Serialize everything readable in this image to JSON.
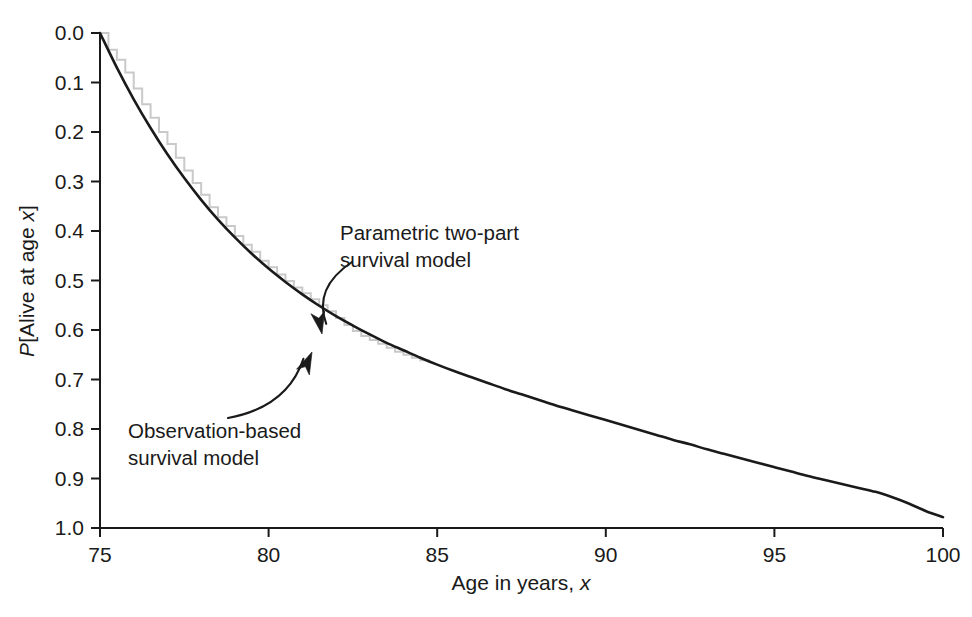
{
  "figure": {
    "background": "#ffffff",
    "plot_area": {
      "x0": 100,
      "y0": 33,
      "x1": 943,
      "y1": 528
    }
  },
  "axes": {
    "x": {
      "label_prefix": "Age in years, ",
      "label_italic": "x",
      "ticks": [
        "75",
        "80",
        "85",
        "90",
        "95",
        "100"
      ],
      "min": 75,
      "max": 100,
      "tick_step": 5,
      "tick_direction": "outward"
    },
    "y": {
      "label_prefix": "P",
      "label_mid": "[Alive at age ",
      "label_italic": "x",
      "label_suffix": "]",
      "ticks": [
        "1.0",
        "0.9",
        "0.8",
        "0.7",
        "0.6",
        "0.5",
        "0.4",
        "0.3",
        "0.2",
        "0.1",
        "0.0"
      ],
      "min": 0.0,
      "max": 1.0,
      "tick_step": 0.1,
      "tick_direction": "outward"
    }
  },
  "annotations": [
    {
      "name": "parametric-model-annotation",
      "line1": "Parametric two-part",
      "line2": "survival model",
      "text_x": 340,
      "text_y": 240,
      "arrow_from": [
        352,
        262
      ],
      "arrow_to": [
        322,
        334
      ],
      "target_series": "parametric"
    },
    {
      "name": "observation-model-annotation",
      "line1": "Observation-based",
      "line2": "survival model",
      "text_x": 128,
      "text_y": 438,
      "arrow_from": [
        228,
        418
      ],
      "arrow_to": [
        312,
        352
      ],
      "target_series": "observation"
    }
  ],
  "chart_data": {
    "type": "line",
    "title": "",
    "xlabel": "Age in years, x",
    "ylabel": "P[Alive at age x]",
    "xlim": [
      75,
      100
    ],
    "ylim": [
      0.0,
      1.0
    ],
    "xticks": [
      75,
      80,
      85,
      90,
      95,
      100
    ],
    "yticks": [
      0.0,
      0.1,
      0.2,
      0.3,
      0.4,
      0.5,
      0.6,
      0.7,
      0.8,
      0.9,
      1.0
    ],
    "grid": false,
    "legend": "annotated-inline",
    "series": [
      {
        "name": "Parametric two-part survival model",
        "color": "#1a1a1a",
        "style": "smooth",
        "linewidth": 2.6,
        "x": [
          75,
          75.5,
          76,
          76.5,
          77,
          77.5,
          78,
          78.5,
          79,
          79.5,
          80,
          80.5,
          81,
          81.5,
          82,
          82.5,
          83,
          83.5,
          84,
          84.5,
          85,
          85.5,
          86,
          86.5,
          87,
          87.5,
          88,
          88.5,
          89,
          89.5,
          90,
          90.5,
          91,
          91.5,
          92,
          92.5,
          93,
          93.5,
          94,
          94.5,
          95,
          95.5,
          96,
          96.5,
          97,
          97.5,
          98,
          98.5,
          99,
          99.5,
          100
        ],
        "y": [
          1.0,
          0.93,
          0.866,
          0.808,
          0.755,
          0.707,
          0.663,
          0.623,
          0.587,
          0.554,
          0.524,
          0.497,
          0.472,
          0.449,
          0.428,
          0.409,
          0.391,
          0.374,
          0.359,
          0.344,
          0.33,
          0.317,
          0.305,
          0.293,
          0.281,
          0.27,
          0.259,
          0.248,
          0.238,
          0.228,
          0.218,
          0.208,
          0.198,
          0.188,
          0.178,
          0.169,
          0.159,
          0.15,
          0.141,
          0.132,
          0.123,
          0.114,
          0.105,
          0.097,
          0.089,
          0.081,
          0.073,
          0.062,
          0.049,
          0.034,
          0.022
        ]
      },
      {
        "name": "Observation-based survival model",
        "color": "#c9c9c9",
        "style": "step",
        "linewidth": 2.0,
        "x": [
          75,
          75.25,
          75.5,
          75.75,
          76,
          76.25,
          76.5,
          76.75,
          77,
          77.25,
          77.5,
          77.75,
          78,
          78.25,
          78.5,
          78.75,
          79,
          79.25,
          79.5,
          79.75,
          80,
          80.25,
          80.5,
          80.75,
          81,
          81.25,
          81.5,
          81.75,
          82,
          82.25,
          82.5,
          82.75,
          83,
          83.25,
          83.5,
          83.75,
          84,
          84.25,
          84.5,
          84.75
        ],
        "y": [
          1.0,
          0.966,
          0.946,
          0.92,
          0.888,
          0.856,
          0.829,
          0.8,
          0.776,
          0.748,
          0.722,
          0.697,
          0.673,
          0.648,
          0.628,
          0.61,
          0.59,
          0.572,
          0.558,
          0.54,
          0.527,
          0.512,
          0.499,
          0.486,
          0.474,
          0.462,
          0.45,
          0.438,
          0.424,
          0.41,
          0.398,
          0.388,
          0.38,
          0.372,
          0.364,
          0.356,
          0.35,
          0.344,
          0.339,
          0.334
        ]
      }
    ]
  }
}
